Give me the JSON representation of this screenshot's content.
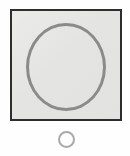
{
  "canvas": {
    "width": 130,
    "height": 156,
    "background_color": "#fefefe",
    "title": "Shape Panel"
  },
  "panel": {
    "name": "framed-square-panel",
    "fill_color": "#e4e4e2",
    "border_color": "#2e2e2e",
    "border_width": 2,
    "x": 10,
    "y": 9,
    "width": 112,
    "height": 112
  },
  "shapes": [
    {
      "name": "large-circle-outline",
      "type": "circle",
      "stroke_color": "#8b8b8b",
      "stroke_width": 3,
      "fill": "none",
      "center_x": 65,
      "center_y": 66,
      "radius": 41
    },
    {
      "name": "small-circle-outline",
      "type": "circle",
      "stroke_color": "#a9a9a9",
      "stroke_width": 2,
      "fill": "#fefefe",
      "center_x": 66,
      "center_y": 140,
      "radius": 8
    }
  ],
  "labels": {
    "panel_label": "",
    "marker_label": ""
  }
}
